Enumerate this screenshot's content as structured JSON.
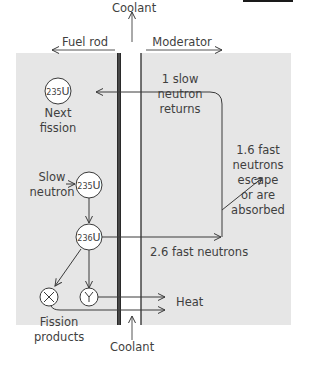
{
  "diagram": {
    "type": "nuclear-fission-reactor-neutron-flow",
    "header": {
      "coolant_top": "Coolant",
      "fuel_rod": "Fuel rod",
      "moderator": "Moderator"
    },
    "footer": {
      "coolant_bottom": "Coolant"
    },
    "nodes": {
      "next_fission": {
        "isotope_mass": "235",
        "element": "U",
        "label_line1": "Next",
        "label_line2": "fission"
      },
      "slow_neutron_target": {
        "isotope_mass": "235",
        "element": "U"
      },
      "compound": {
        "isotope_mass": "236",
        "element": "U"
      },
      "product_x": {
        "symbol": "X"
      },
      "product_y": {
        "symbol": "Y"
      }
    },
    "labels": {
      "slow_neutron_line1": "Slow",
      "slow_neutron_line2": "neutron",
      "slow_returns_line1": "1 slow",
      "slow_returns_line2": "neutron",
      "slow_returns_line3": "returns",
      "fast_escape_line1": "1.6 fast",
      "fast_escape_line2": "neutrons",
      "fast_escape_line3": "escape",
      "fast_escape_line4": "or are",
      "fast_escape_line5": "absorbed",
      "fast_neutrons": "2.6 fast neutrons",
      "heat": "Heat",
      "fission_products_line1": "Fission",
      "fission_products_line2": "products"
    },
    "colors": {
      "panel": "#e6e6e6",
      "lines": "#3a3a3a",
      "text": "#3f3f3f",
      "node_fill": "#ffffff"
    }
  }
}
